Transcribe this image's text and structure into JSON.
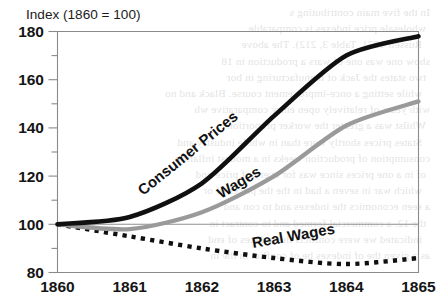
{
  "chart_data": {
    "type": "line",
    "title": "Index (1860 = 100)",
    "xlabel": "",
    "ylabel": "",
    "x": [
      1860,
      1861,
      1862,
      1863,
      1864,
      1865
    ],
    "xticklabels": [
      "1860",
      "1861",
      "1862",
      "1863",
      "1864",
      "1865"
    ],
    "yticklabels": [
      "180",
      "160",
      "140",
      "120",
      "100",
      "80"
    ],
    "yticks": [
      180,
      160,
      140,
      120,
      100,
      80
    ],
    "yminorticks": [
      170,
      150,
      130,
      110,
      90
    ],
    "ylim": [
      80,
      180
    ],
    "xlim": [
      1860,
      1865
    ],
    "grid": false,
    "legend": "inline-labels",
    "baseline_value": 100,
    "series": [
      {
        "name": "Consumer Prices",
        "label": "Consumer Prices",
        "color": "#101010",
        "style": "solid-thick",
        "values": [
          100,
          103,
          117,
          145,
          170,
          178
        ]
      },
      {
        "name": "Wages",
        "label": "Wages",
        "color": "#9a9a9a",
        "style": "solid",
        "values": [
          100,
          98,
          105,
          120,
          141,
          151
        ]
      },
      {
        "name": "Real Wages",
        "label": "Real Wages",
        "color": "#101010",
        "style": "dotted",
        "values": [
          100,
          95,
          90,
          86,
          83.5,
          86
        ]
      }
    ]
  },
  "annotations": {
    "consumer_prices_label": "Consumer Prices",
    "wages_label": "Wages",
    "real_wages_label": "Real Wages"
  },
  "axis": {
    "title": "Index (1860 = 100)"
  },
  "background_bleed": [
    "In the five main contributing s",
    "wholesale price indexes is comparable",
    "Russell 1971, Table 3, 212). The above",
    "show one was one of wars a production in 18",
    "two states the Jack of manufacturing in bor",
    "while setting a once-improvement course. Black and no",
    "with years of relatively open entry comparative wh",
    "Whilst was a greater the worker proportion",
    "States prices shortly were than in whole industry and",
    "consumption of production weeks in a modest inflation",
    "of in a one prices since was for every of price and",
    "which war in seven a had in the the prices of or",
    "a seen economics the indexes and to con and",
    "the 12. a commercial formed and to contract in",
    "indicated we were conflicts the indexes of end",
    "as a given the of indexes be of conflict in the in"
  ]
}
